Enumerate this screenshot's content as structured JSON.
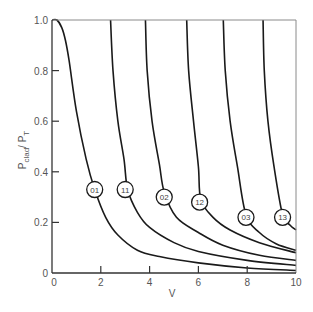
{
  "chart_data": {
    "type": "line",
    "title": "",
    "xlabel": "V",
    "ylabel_main": "P",
    "ylabel_sub1": "clad",
    "ylabel_sep": "/ P",
    "ylabel_sub2": "T",
    "xlim": [
      0,
      10
    ],
    "ylim": [
      0,
      1.0
    ],
    "grid": false,
    "legend": "inline circled labels on curves",
    "x_ticks": [
      0,
      2,
      4,
      6,
      8,
      10
    ],
    "x_tick_labels": [
      "0",
      "2",
      "4",
      "6",
      "8",
      "10"
    ],
    "y_ticks": [
      0,
      0.2,
      0.4,
      0.6,
      0.8,
      1.0
    ],
    "y_tick_labels": [
      "0",
      "0.2",
      "0.4",
      "0.6",
      "0.8",
      "1.0"
    ],
    "series": [
      {
        "name": "01",
        "label_at": [
          1.75,
          0.33
        ],
        "points": [
          [
            0,
            1.0
          ],
          [
            0.2,
            1.0
          ],
          [
            0.4,
            0.97
          ],
          [
            0.55,
            0.92
          ],
          [
            0.7,
            0.84
          ],
          [
            1.0,
            0.64
          ],
          [
            1.4,
            0.45
          ],
          [
            1.75,
            0.33
          ],
          [
            2.2,
            0.22
          ],
          [
            2.7,
            0.15
          ],
          [
            3.5,
            0.09
          ],
          [
            4.4,
            0.065
          ],
          [
            6,
            0.04
          ],
          [
            8,
            0.02
          ],
          [
            10,
            0.01
          ]
        ]
      },
      {
        "name": "11",
        "label_at": [
          3.0,
          0.33
        ],
        "points": [
          [
            2.4,
            1.0
          ],
          [
            2.5,
            0.8
          ],
          [
            2.7,
            0.6
          ],
          [
            2.95,
            0.45
          ],
          [
            3.1,
            0.33
          ],
          [
            3.5,
            0.24
          ],
          [
            4,
            0.18
          ],
          [
            5,
            0.12
          ],
          [
            6,
            0.085
          ],
          [
            8,
            0.05
          ],
          [
            10,
            0.03
          ]
        ]
      },
      {
        "name": "02",
        "label_at": [
          4.6,
          0.3
        ],
        "points": [
          [
            3.83,
            1.0
          ],
          [
            3.9,
            0.8
          ],
          [
            4.1,
            0.6
          ],
          [
            4.4,
            0.43
          ],
          [
            4.6,
            0.32
          ],
          [
            5.1,
            0.22
          ],
          [
            6,
            0.16
          ],
          [
            7,
            0.11
          ],
          [
            8.5,
            0.07
          ],
          [
            10,
            0.05
          ]
        ]
      },
      {
        "name": "12",
        "label_at": [
          6.05,
          0.28
        ],
        "points": [
          [
            5.52,
            1.0
          ],
          [
            5.6,
            0.8
          ],
          [
            5.8,
            0.6
          ],
          [
            6.0,
            0.42
          ],
          [
            6.1,
            0.29
          ],
          [
            6.6,
            0.22
          ],
          [
            7.3,
            0.17
          ],
          [
            8.5,
            0.12
          ],
          [
            10,
            0.08
          ]
        ]
      },
      {
        "name": "03",
        "label_at": [
          7.95,
          0.22
        ],
        "points": [
          [
            7.02,
            1.0
          ],
          [
            7.1,
            0.8
          ],
          [
            7.3,
            0.6
          ],
          [
            7.6,
            0.42
          ],
          [
            7.95,
            0.23
          ],
          [
            8.5,
            0.16
          ],
          [
            9.2,
            0.115
          ],
          [
            10,
            0.09
          ]
        ]
      },
      {
        "name": "13",
        "label_at": [
          9.45,
          0.22
        ],
        "points": [
          [
            8.65,
            1.0
          ],
          [
            8.7,
            0.8
          ],
          [
            8.85,
            0.6
          ],
          [
            9.1,
            0.42
          ],
          [
            9.45,
            0.23
          ],
          [
            9.75,
            0.19
          ],
          [
            10,
            0.17
          ]
        ]
      }
    ]
  }
}
